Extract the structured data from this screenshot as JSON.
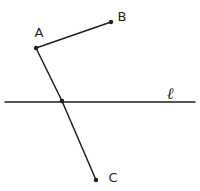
{
  "diagram": {
    "background_color": "#ffffff",
    "ink_color": "#1f1f1f",
    "points": [
      {
        "name": "A",
        "x": 36,
        "y": 48,
        "dot": true,
        "label": "A",
        "label_x": 39,
        "label_y": 37
      },
      {
        "name": "B",
        "x": 111,
        "y": 22,
        "dot": true,
        "label": "B",
        "label_x": 122,
        "label_y": 21
      },
      {
        "name": "C",
        "x": 96,
        "y": 180,
        "dot": true,
        "label": "C",
        "label_x": 113,
        "label_y": 182
      },
      {
        "name": "intersection",
        "x": 62,
        "y": 101,
        "dot": true,
        "label": ""
      }
    ],
    "segments": [
      {
        "name": "AB",
        "points": [
          "A",
          "B"
        ]
      },
      {
        "name": "AC",
        "points": [
          "A",
          "intersection",
          "C"
        ]
      }
    ],
    "lines": [
      {
        "name": "l",
        "x1": 5,
        "y1": 102,
        "x2": 195,
        "y2": 102,
        "label": "ℓ",
        "label_x": 170,
        "label_y": 99
      }
    ]
  }
}
